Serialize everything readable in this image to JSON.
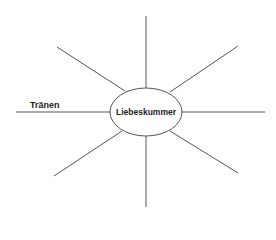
{
  "diagram": {
    "type": "mind-map",
    "center": {
      "label": "Liebeskummer"
    },
    "branches": [
      {
        "position": "left",
        "label": "Tränen"
      },
      {
        "position": "upper-left",
        "label": ""
      },
      {
        "position": "top",
        "label": ""
      },
      {
        "position": "upper-right",
        "label": ""
      },
      {
        "position": "right",
        "label": ""
      },
      {
        "position": "lower-right",
        "label": ""
      },
      {
        "position": "bottom",
        "label": ""
      },
      {
        "position": "lower-left",
        "label": ""
      }
    ],
    "colors": {
      "line": "#555555",
      "text": "#222222",
      "background": "#ffffff"
    }
  }
}
